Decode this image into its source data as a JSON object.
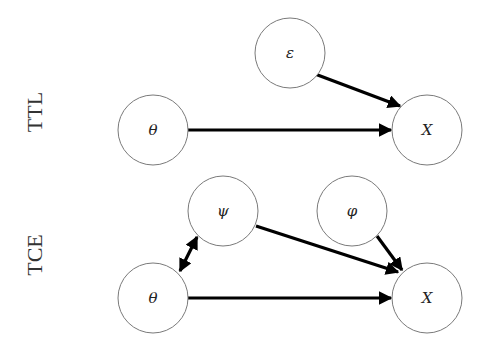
{
  "diagram": {
    "rows": [
      {
        "label": "TTL",
        "nodes": [
          {
            "id": "ttl_theta",
            "label": "θ"
          },
          {
            "id": "ttl_eps",
            "label": "ε"
          },
          {
            "id": "ttl_x",
            "label": "X"
          }
        ],
        "edges": [
          {
            "from": "θ",
            "to": "X",
            "type": "directed"
          },
          {
            "from": "ε",
            "to": "X",
            "type": "directed"
          }
        ]
      },
      {
        "label": "TCE",
        "nodes": [
          {
            "id": "tce_theta",
            "label": "θ"
          },
          {
            "id": "tce_psi",
            "label": "ψ"
          },
          {
            "id": "tce_phi",
            "label": "φ"
          },
          {
            "id": "tce_x",
            "label": "X"
          }
        ],
        "edges": [
          {
            "from": "θ",
            "to": "X",
            "type": "directed"
          },
          {
            "from": "ψ",
            "to": "X",
            "type": "directed"
          },
          {
            "from": "φ",
            "to": "X",
            "type": "directed"
          },
          {
            "from": "θ",
            "to": "ψ",
            "type": "bidirected"
          }
        ]
      }
    ]
  }
}
